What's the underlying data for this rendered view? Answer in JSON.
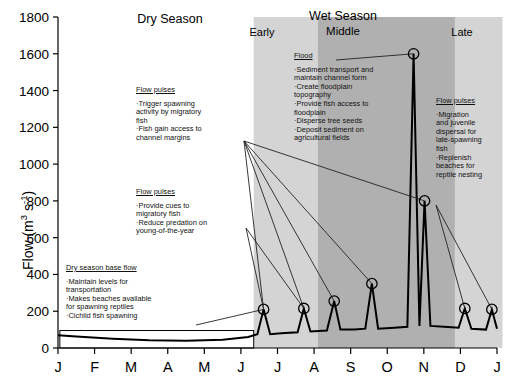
{
  "axes": {
    "y_label": "Flow (m",
    "y_label_sup1": "3",
    "y_label_mid": " s",
    "y_label_sup2": "-1",
    "y_label_end": ")"
  },
  "seasons": [
    {
      "name": "dry-season",
      "label": "Dry Season"
    },
    {
      "name": "wet-season",
      "label": "Wet Season"
    },
    {
      "name": "wet-early",
      "label": "Early"
    },
    {
      "name": "wet-middle",
      "label": "Middle"
    },
    {
      "name": "wet-late",
      "label": "Late"
    }
  ],
  "annotations": [
    {
      "name": "flow-pulses-dry-upper",
      "heading": "Flow pulses",
      "bullets": [
        "·Trigger spawning",
        "activity by migratory",
        "fish",
        "·Fish gain access to",
        "channel margins"
      ]
    },
    {
      "name": "flow-pulses-dry-lower",
      "heading": "Flow pulses",
      "bullets": [
        "·Provide cues to",
        "migratory fish",
        "·Reduce predation on",
        "young-of-the-year"
      ]
    },
    {
      "name": "dry-season-base-flow",
      "heading": "Dry season base flow",
      "bullets": [
        "·Maintain levels for",
        "transportation",
        "·Makes beaches available",
        "for spawning reptiles",
        "·Cichlid fish spawning"
      ]
    },
    {
      "name": "flood",
      "heading": "Flood",
      "bullets": [
        "·Sediment transport and",
        "maintain channel form",
        "·Create floodplain",
        "topography",
        "·Provide fish access to",
        "floodplain",
        "·Disperse tree seeds",
        "·Deposit sediment on",
        "agricultural fields"
      ]
    },
    {
      "name": "flow-pulses-late",
      "heading": "Flow pulses",
      "bullets": [
        "·Migration",
        "and juvenile",
        "dispersal for",
        "late-spawning",
        "fish",
        "·Replenish",
        "beaches for",
        "reptile nesting"
      ]
    }
  ],
  "colors": {
    "band_light": "#d4d4d4",
    "band_dark": "#b0b0b0",
    "line": "#000000",
    "leader": "#222222"
  },
  "chart_data": {
    "type": "line",
    "title": "",
    "xlabel": "",
    "ylabel": "Flow (m3 s-1)",
    "xtick_labels": [
      "J",
      "F",
      "M",
      "A",
      "M",
      "J",
      "J",
      "A",
      "S",
      "O",
      "N",
      "D",
      "J"
    ],
    "ytick_labels": [
      "0",
      "200",
      "400",
      "600",
      "800",
      "1000",
      "1200",
      "1400",
      "1600",
      "1800"
    ],
    "ylim": [
      0,
      1800
    ],
    "ytick_step": 200,
    "grid": false,
    "legend": false,
    "x_unit": "month",
    "series": [
      {
        "name": "hydrograph",
        "comment": "Annual flow regime: low dry-season base flow Jan-Jun, rising flow pulses Jun-Aug, major flood peak in Oct-Nov, secondary peak, then declining pulses Dec-Jan",
        "points": [
          {
            "x": 0.0,
            "y": 70
          },
          {
            "x": 0.5,
            "y": 62
          },
          {
            "x": 1.5,
            "y": 50
          },
          {
            "x": 2.5,
            "y": 42
          },
          {
            "x": 3.5,
            "y": 40
          },
          {
            "x": 4.5,
            "y": 45
          },
          {
            "x": 5.2,
            "y": 60
          },
          {
            "x": 5.45,
            "y": 75
          },
          {
            "x": 5.62,
            "y": 210
          },
          {
            "x": 5.8,
            "y": 75
          },
          {
            "x": 6.1,
            "y": 80
          },
          {
            "x": 6.55,
            "y": 85
          },
          {
            "x": 6.72,
            "y": 215
          },
          {
            "x": 6.9,
            "y": 90
          },
          {
            "x": 7.35,
            "y": 95
          },
          {
            "x": 7.55,
            "y": 255
          },
          {
            "x": 7.72,
            "y": 100
          },
          {
            "x": 8.1,
            "y": 100
          },
          {
            "x": 8.4,
            "y": 105
          },
          {
            "x": 8.58,
            "y": 350
          },
          {
            "x": 8.75,
            "y": 105
          },
          {
            "x": 9.2,
            "y": 110
          },
          {
            "x": 9.55,
            "y": 115
          },
          {
            "x": 9.72,
            "y": 1600
          },
          {
            "x": 9.88,
            "y": 120
          },
          {
            "x": 10.02,
            "y": 800
          },
          {
            "x": 10.18,
            "y": 120
          },
          {
            "x": 10.55,
            "y": 115
          },
          {
            "x": 10.95,
            "y": 110
          },
          {
            "x": 11.12,
            "y": 215
          },
          {
            "x": 11.3,
            "y": 105
          },
          {
            "x": 11.7,
            "y": 100
          },
          {
            "x": 11.86,
            "y": 210
          },
          {
            "x": 12.0,
            "y": 105
          }
        ]
      }
    ],
    "markers": [
      {
        "name": "marker-jun-pulse",
        "x": 5.62,
        "y": 210
      },
      {
        "name": "marker-jul-pulse",
        "x": 6.72,
        "y": 215
      },
      {
        "name": "marker-aug-pulse",
        "x": 7.55,
        "y": 255
      },
      {
        "name": "marker-sep-pulse",
        "x": 8.58,
        "y": 350
      },
      {
        "name": "marker-flood-peak",
        "x": 9.72,
        "y": 1600
      },
      {
        "name": "marker-secondary-peak",
        "x": 10.02,
        "y": 800
      },
      {
        "name": "marker-dec-pulse",
        "x": 11.12,
        "y": 215
      },
      {
        "name": "marker-jan-pulse",
        "x": 11.86,
        "y": 210
      }
    ],
    "base_flow_box": {
      "name": "dry-season-base-flow-box",
      "x0": 0.05,
      "x1": 5.35,
      "y0": 0,
      "y1": 95
    },
    "bands": [
      {
        "name": "band-early",
        "x0": 5.35,
        "x1": 7.1,
        "shade": "light"
      },
      {
        "name": "band-middle",
        "x0": 7.1,
        "x1": 10.85,
        "shade": "dark"
      },
      {
        "name": "band-late",
        "x0": 10.85,
        "x1": 12.15,
        "shade": "light"
      }
    ]
  }
}
